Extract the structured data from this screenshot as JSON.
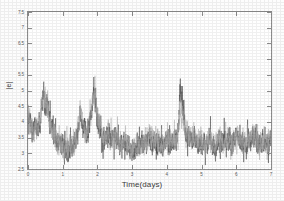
{
  "chart_data": {
    "type": "line",
    "title": "",
    "xlabel": "Time(days)",
    "ylabel": "|e|",
    "xlim": [
      0,
      7
    ],
    "ylim": [
      2.5,
      7.5
    ],
    "xticks": [
      "0",
      "1",
      "2",
      "3",
      "4",
      "5",
      "6",
      "7"
    ],
    "yticks": [
      "2.5",
      "3",
      "3.5",
      "4",
      "4.5",
      "5",
      "5.5",
      "6",
      "6.5",
      "7",
      "7.5"
    ],
    "grid": false,
    "legend": "none",
    "series": [
      {
        "name": "series-dark",
        "color": "#4d4d4d",
        "style": "solid",
        "baseline": 3.2,
        "noise": 0.3,
        "x": [
          0.0,
          0.05,
          0.1,
          0.15,
          0.2,
          0.25,
          0.3,
          0.35,
          0.4,
          0.45,
          0.5,
          0.55,
          0.6,
          0.65,
          0.7,
          0.75,
          0.8,
          0.85,
          0.9,
          0.95,
          1.0,
          1.1,
          1.2,
          1.3,
          1.4,
          1.5,
          1.6,
          1.7,
          1.8,
          1.9,
          2.0,
          2.1,
          2.2,
          2.3,
          2.4,
          2.5,
          2.6,
          2.7,
          2.8,
          2.9,
          3.0,
          3.1,
          3.2,
          3.3,
          3.4,
          3.5,
          3.6,
          3.7,
          3.8,
          3.9,
          4.0,
          4.1,
          4.2,
          4.3,
          4.4,
          4.5,
          4.6,
          4.7,
          4.8,
          4.9,
          5.0,
          5.1,
          5.2,
          5.3,
          5.4,
          5.5,
          5.6,
          5.7,
          5.8,
          5.9,
          6.0,
          6.1,
          6.2,
          6.3,
          6.4,
          6.5,
          6.6,
          6.7,
          6.8,
          6.9,
          7.0
        ],
        "y": [
          4.35,
          4.05,
          3.85,
          3.7,
          3.95,
          3.6,
          3.8,
          4.15,
          4.55,
          5.05,
          4.35,
          4.6,
          4.3,
          3.95,
          3.7,
          3.55,
          3.4,
          3.3,
          3.2,
          3.15,
          3.1,
          3.05,
          3.2,
          3.15,
          3.45,
          4.25,
          3.8,
          3.5,
          4.05,
          5.05,
          4.1,
          3.6,
          3.45,
          3.7,
          3.35,
          3.55,
          3.3,
          3.25,
          3.35,
          3.2,
          3.1,
          3.15,
          3.25,
          3.3,
          3.2,
          3.55,
          3.35,
          3.25,
          3.3,
          3.2,
          3.45,
          3.3,
          3.35,
          3.6,
          5.0,
          3.9,
          3.55,
          3.35,
          3.45,
          3.3,
          3.4,
          3.25,
          3.35,
          3.3,
          3.2,
          3.4,
          3.25,
          3.3,
          3.35,
          3.25,
          3.55,
          3.4,
          3.3,
          3.25,
          3.45,
          3.6,
          3.35,
          3.3,
          3.4,
          3.25,
          3.35
        ]
      },
      {
        "name": "series-light",
        "color": "#a8a8a8",
        "style": "solid",
        "baseline": 3.25,
        "noise": 0.3,
        "x": [
          0.0,
          0.05,
          0.1,
          0.15,
          0.2,
          0.25,
          0.3,
          0.35,
          0.4,
          0.45,
          0.5,
          0.55,
          0.6,
          0.65,
          0.7,
          0.75,
          0.8,
          0.85,
          0.9,
          0.95,
          1.0,
          1.1,
          1.2,
          1.3,
          1.4,
          1.5,
          1.6,
          1.7,
          1.8,
          1.9,
          2.0,
          2.1,
          2.2,
          2.3,
          2.4,
          2.5,
          2.6,
          2.7,
          2.8,
          2.9,
          3.0,
          3.1,
          3.2,
          3.3,
          3.4,
          3.5,
          3.6,
          3.7,
          3.8,
          3.9,
          4.0,
          4.1,
          4.2,
          4.3,
          4.4,
          4.5,
          4.6,
          4.7,
          4.8,
          4.9,
          5.0,
          5.1,
          5.2,
          5.3,
          5.4,
          5.5,
          5.6,
          5.7,
          5.8,
          5.9,
          6.0,
          6.1,
          6.2,
          6.3,
          6.4,
          6.5,
          6.6,
          6.7,
          6.8,
          6.9,
          7.0
        ],
        "y": [
          4.3,
          4.1,
          3.8,
          3.6,
          3.9,
          3.65,
          3.85,
          4.25,
          4.6,
          4.7,
          4.45,
          4.5,
          4.2,
          3.85,
          3.65,
          3.5,
          3.45,
          3.35,
          3.25,
          3.2,
          3.15,
          3.1,
          3.25,
          3.2,
          3.55,
          4.4,
          3.85,
          3.55,
          4.2,
          4.95,
          4.2,
          3.7,
          3.5,
          3.75,
          3.4,
          3.5,
          3.35,
          3.3,
          3.4,
          3.25,
          3.15,
          3.2,
          3.3,
          3.35,
          3.25,
          3.6,
          3.4,
          3.3,
          3.35,
          3.25,
          3.5,
          3.35,
          3.4,
          3.55,
          4.55,
          3.95,
          3.6,
          3.4,
          3.5,
          3.35,
          3.45,
          3.3,
          3.4,
          3.35,
          3.25,
          3.45,
          3.3,
          3.35,
          3.4,
          3.3,
          3.6,
          3.45,
          3.35,
          3.3,
          3.5,
          3.55,
          3.4,
          3.35,
          3.45,
          3.3,
          3.4
        ]
      }
    ]
  },
  "figure": {
    "background": "#ffffff",
    "axis_color": "#8d8d8d"
  }
}
